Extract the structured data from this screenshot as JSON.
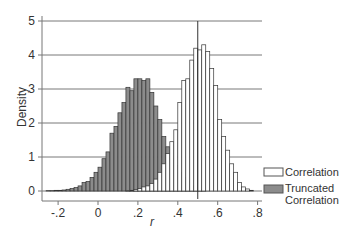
{
  "chart_data": {
    "type": "bar",
    "subtype": "overlaid-histogram",
    "title": "",
    "xlabel": "r",
    "ylabel": "Density",
    "xlim": [
      -0.27,
      0.82
    ],
    "ylim": [
      -0.1,
      5.1
    ],
    "x_ticks": [
      -0.2,
      0,
      0.2,
      0.4,
      0.6,
      0.8
    ],
    "x_tick_labels": [
      "-.2",
      "0",
      ".2",
      ".4",
      ".6",
      ".8"
    ],
    "y_ticks": [
      0,
      1,
      2,
      3,
      4,
      5
    ],
    "y_tick_labels": [
      "0",
      "1",
      "2",
      "3",
      "4",
      "5"
    ],
    "grid": "horizontal",
    "reference_line_x": 0.5,
    "bin_width": 0.02,
    "legend_position": "right",
    "series": [
      {
        "name": "Correlation",
        "fill": "#ffffff",
        "stroke": "#333333",
        "bin_starts": [
          0.14,
          0.16,
          0.18,
          0.2,
          0.22,
          0.24,
          0.26,
          0.28,
          0.3,
          0.32,
          0.34,
          0.36,
          0.38,
          0.4,
          0.42,
          0.44,
          0.46,
          0.48,
          0.5,
          0.52,
          0.54,
          0.56,
          0.58,
          0.6,
          0.62,
          0.64,
          0.66,
          0.68,
          0.7,
          0.72,
          0.74,
          0.76
        ],
        "values": [
          0.01,
          0.02,
          0.04,
          0.07,
          0.12,
          0.15,
          0.22,
          0.35,
          0.55,
          0.8,
          1.1,
          1.45,
          1.8,
          2.6,
          3.25,
          3.3,
          3.85,
          4.2,
          4.15,
          4.3,
          4.1,
          3.6,
          3.1,
          2.1,
          1.6,
          1.2,
          0.8,
          0.55,
          0.25,
          0.12,
          0.06,
          0.02
        ]
      },
      {
        "name": "Truncated Correlation",
        "fill": "#8c8c8c",
        "stroke": "#333333",
        "bin_starts": [
          -0.26,
          -0.24,
          -0.22,
          -0.2,
          -0.18,
          -0.16,
          -0.14,
          -0.12,
          -0.1,
          -0.08,
          -0.06,
          -0.04,
          -0.02,
          0.0,
          0.02,
          0.04,
          0.06,
          0.08,
          0.1,
          0.12,
          0.14,
          0.16,
          0.18,
          0.2,
          0.22,
          0.24,
          0.26,
          0.28,
          0.3,
          0.32,
          0.34,
          0.36,
          0.38,
          0.4,
          0.42,
          0.44,
          0.46,
          0.48,
          0.5,
          0.52
        ],
        "values": [
          0.01,
          0.01,
          0.02,
          0.02,
          0.03,
          0.05,
          0.07,
          0.1,
          0.15,
          0.25,
          0.28,
          0.4,
          0.55,
          0.7,
          0.95,
          1.15,
          1.7,
          1.9,
          2.3,
          2.6,
          3.05,
          2.95,
          3.3,
          3.3,
          3.25,
          3.3,
          2.9,
          2.5,
          2.1,
          1.6,
          1.3,
          0.95,
          0.75,
          0.55,
          0.4,
          0.3,
          0.15,
          0.1,
          0.05,
          0.02
        ]
      }
    ]
  },
  "legend": {
    "items": [
      {
        "label": "Correlation"
      },
      {
        "label_line1": "Truncated",
        "label_line2": "Correlation"
      }
    ]
  },
  "axes": {
    "xlabel": "r",
    "ylabel": "Density"
  }
}
